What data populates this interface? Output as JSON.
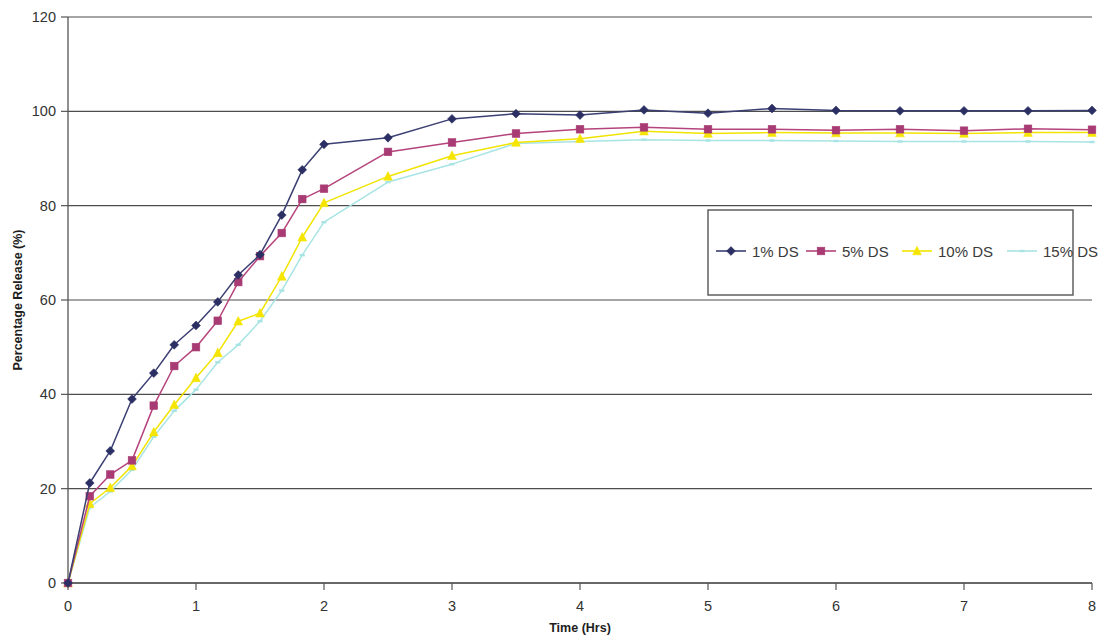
{
  "chart_data": {
    "type": "line",
    "title": "",
    "xlabel": "Time (Hrs)",
    "ylabel": "Percentage Release (%)",
    "xlim": [
      0,
      8
    ],
    "ylim": [
      0,
      120
    ],
    "xticks": [
      "0",
      "1",
      "2",
      "3",
      "4",
      "5",
      "6",
      "7",
      "8"
    ],
    "yticks": [
      "0",
      "20",
      "40",
      "60",
      "80",
      "100",
      "120"
    ],
    "grid": "horizontal",
    "legend_position": "inside-right",
    "series": [
      {
        "name": "1% DS",
        "color": "#3b3f72",
        "marker": "diamond",
        "marker_color": "#2b2f63",
        "x": [
          0,
          0.17,
          0.33,
          0.5,
          0.67,
          0.83,
          1.0,
          1.17,
          1.33,
          1.5,
          1.67,
          1.83,
          2.0,
          2.5,
          3.0,
          3.5,
          4.0,
          4.5,
          5.0,
          5.5,
          6.0,
          6.5,
          7.0,
          7.5,
          8.0
        ],
        "y": [
          0,
          21.2,
          28.0,
          39.0,
          44.5,
          50.5,
          54.6,
          59.6,
          65.3,
          69.6,
          78.0,
          87.6,
          93.0,
          94.4,
          98.4,
          99.5,
          99.2,
          100.3,
          99.6,
          100.6,
          100.2,
          100.1,
          100.1,
          100.1,
          100.2
        ]
      },
      {
        "name": "5% DS",
        "color": "#b5447c",
        "marker": "square",
        "marker_color": "#a83b73",
        "x": [
          0,
          0.17,
          0.33,
          0.5,
          0.67,
          0.83,
          1.0,
          1.17,
          1.33,
          1.5,
          1.67,
          1.83,
          2.0,
          2.5,
          3.0,
          3.5,
          4.0,
          4.5,
          5.0,
          5.5,
          6.0,
          6.5,
          7.0,
          7.5,
          8.0
        ],
        "y": [
          0,
          18.4,
          23.0,
          26.0,
          37.6,
          46.0,
          50.0,
          55.6,
          63.8,
          69.3,
          74.2,
          81.4,
          83.6,
          91.4,
          93.4,
          95.3,
          96.2,
          96.6,
          96.2,
          96.2,
          96.0,
          96.2,
          95.9,
          96.3,
          96.1
        ]
      },
      {
        "name": "10% DS",
        "color": "#f2e400",
        "marker": "triangle",
        "marker_color": "#f5e500",
        "x": [
          0,
          0.17,
          0.33,
          0.5,
          0.67,
          0.83,
          1.0,
          1.17,
          1.33,
          1.5,
          1.67,
          1.83,
          2.0,
          2.5,
          3.0,
          3.5,
          4.0,
          4.5,
          5.0,
          5.5,
          6.0,
          6.5,
          7.0,
          7.5,
          8.0
        ],
        "y": [
          0,
          16.8,
          20.2,
          24.8,
          32.0,
          37.8,
          43.5,
          48.8,
          55.5,
          57.2,
          65.0,
          73.3,
          80.6,
          86.2,
          90.6,
          93.4,
          94.2,
          95.8,
          95.3,
          95.5,
          95.4,
          95.4,
          95.3,
          95.5,
          95.5
        ]
      },
      {
        "name": "15% DS",
        "color": "#a8e4e4",
        "marker": "dash",
        "marker_color": "#a8e4e4",
        "x": [
          0,
          0.17,
          0.33,
          0.5,
          0.67,
          0.83,
          1.0,
          1.17,
          1.33,
          1.5,
          1.67,
          1.83,
          2.0,
          2.5,
          3.0,
          3.5,
          4.0,
          4.5,
          5.0,
          5.5,
          6.0,
          6.5,
          7.0,
          7.5,
          8.0
        ],
        "y": [
          0,
          16.0,
          19.4,
          24.0,
          31.0,
          36.5,
          41.0,
          46.8,
          50.5,
          55.5,
          62.0,
          69.5,
          76.5,
          85.0,
          88.8,
          93.2,
          93.6,
          94.0,
          93.8,
          93.8,
          93.7,
          93.6,
          93.6,
          93.6,
          93.5
        ]
      }
    ]
  },
  "legend": {
    "entries": [
      {
        "label": "1% DS"
      },
      {
        "label": "5% DS"
      },
      {
        "label": "10% DS"
      },
      {
        "label": "15% DS"
      }
    ]
  },
  "colors": {
    "axis": "#555555",
    "grid": "#4d4d4d",
    "legend_border": "#555555",
    "background": "#ffffff"
  }
}
